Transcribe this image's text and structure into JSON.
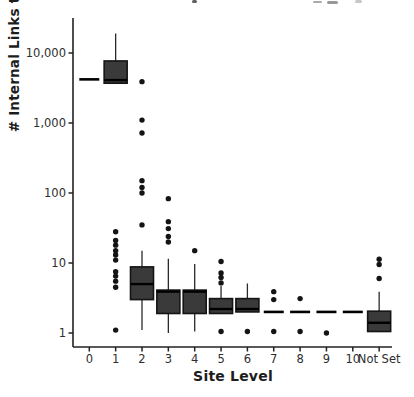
{
  "colors": {
    "box_fill": "#3a3a3a",
    "box_stroke": "#141414",
    "median": "#000000",
    "whisker": "#2a2a2a",
    "outlier": "#141414",
    "axis": "#222222",
    "tick_text": "#2e2e2e",
    "label_text": "#1c1c1c"
  },
  "chart_data": {
    "type": "boxplot",
    "title": "",
    "xlabel": "Site Level",
    "ylabel": "# Internal Links to URL",
    "y_scale": "log10",
    "grid": false,
    "legend": "none",
    "ylim": [
      0.9,
      30000
    ],
    "y_ticks": [
      10000,
      1000,
      100,
      10,
      1
    ],
    "y_tick_labels": [
      "10,000",
      "1,000",
      "100",
      "10",
      "1"
    ],
    "categories": [
      "0",
      "1",
      "2",
      "3",
      "4",
      "5",
      "6",
      "7",
      "8",
      "9",
      "10",
      "Not Set"
    ],
    "boxes": [
      {
        "level": "0",
        "median": 4200,
        "q1": 4200,
        "q3": 4200,
        "whisker_low": 4200,
        "whisker_high": 4200,
        "outliers": []
      },
      {
        "level": "1",
        "median": 4100,
        "q1": 3700,
        "q3": 7700,
        "whisker_low": 3700,
        "whisker_high": 19000,
        "outliers": [
          28,
          21,
          18,
          15,
          13,
          11,
          7.5,
          6.5,
          5.5,
          4.5,
          1.1
        ]
      },
      {
        "level": "2",
        "median": 5,
        "q1": 3,
        "q3": 8.8,
        "whisker_low": 1.1,
        "whisker_high": 15,
        "outliers": [
          3900,
          1100,
          720,
          150,
          120,
          100,
          35
        ]
      },
      {
        "level": "3",
        "median": 3.9,
        "q1": 1.9,
        "q3": 4.1,
        "whisker_low": 1.0,
        "whisker_high": 11.5,
        "outliers": [
          83,
          39,
          31,
          24,
          20
        ]
      },
      {
        "level": "4",
        "median": 3.9,
        "q1": 1.9,
        "q3": 4.1,
        "whisker_low": 1.05,
        "whisker_high": 9.7,
        "outliers": [
          15
        ]
      },
      {
        "level": "5",
        "median": 2.2,
        "q1": 1.9,
        "q3": 3.1,
        "whisker_low": 1.9,
        "whisker_high": 4.7,
        "outliers": [
          10.5,
          7.2,
          6.2,
          5.2,
          1.05
        ]
      },
      {
        "level": "6",
        "median": 2.2,
        "q1": 2.0,
        "q3": 3.1,
        "whisker_low": 2.0,
        "whisker_high": 5.1,
        "outliers": [
          1.05
        ]
      },
      {
        "level": "7",
        "median": 2,
        "q1": 2,
        "q3": 2,
        "whisker_low": 2,
        "whisker_high": 2,
        "outliers": [
          3.9,
          3.0,
          1.05
        ]
      },
      {
        "level": "8",
        "median": 2,
        "q1": 2,
        "q3": 2,
        "whisker_low": 2,
        "whisker_high": 2,
        "outliers": [
          3.1,
          1.05
        ]
      },
      {
        "level": "9",
        "median": 2,
        "q1": 2,
        "q3": 2,
        "whisker_low": 2,
        "whisker_high": 2,
        "outliers": [
          1.0
        ]
      },
      {
        "level": "10",
        "median": 2,
        "q1": 2,
        "q3": 2,
        "whisker_low": 2,
        "whisker_high": 2,
        "outliers": []
      },
      {
        "level": "Not Set",
        "median": 1.4,
        "q1": 1.05,
        "q3": 2.05,
        "whisker_low": 1.05,
        "whisker_high": 3.9,
        "outliers": [
          11.3,
          9.5,
          6.0
        ]
      }
    ]
  }
}
